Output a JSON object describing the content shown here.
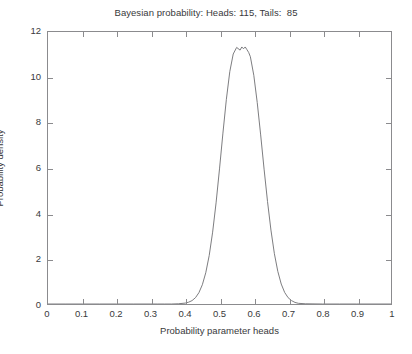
{
  "figure": {
    "background_color": "#ffffff",
    "axes_color": "#8b8b8e",
    "text_color": "#39393b",
    "curve_color": "#6e6e72"
  },
  "chart_data": {
    "type": "line",
    "title": "Bayesian probability: Heads: 115, Tails:  85",
    "xlabel": "Probability parameter heads",
    "ylabel": "Probability density",
    "xlim": [
      0,
      1
    ],
    "ylim": [
      0,
      12
    ],
    "grid": false,
    "legend": null,
    "xticks": [
      0,
      0.1,
      0.2,
      0.3,
      0.4,
      0.5,
      0.6,
      0.7,
      0.8,
      0.9,
      1
    ],
    "xtick_labels": [
      "0",
      "0.1",
      "0.2",
      "0.3",
      "0.4",
      "0.5",
      "0.6",
      "0.7",
      "0.8",
      "0.9",
      "1"
    ],
    "yticks": [
      0,
      2,
      4,
      6,
      8,
      10,
      12
    ],
    "ytick_labels": [
      "0",
      "2",
      "4",
      "6",
      "8",
      "10",
      "12"
    ],
    "observations": {
      "heads": 115,
      "tails": 85,
      "total": 200
    },
    "distribution": {
      "name": "Beta posterior",
      "alpha": 116,
      "beta": 86,
      "mode": 0.575,
      "mean": 0.5743,
      "peak_density": 11.34
    },
    "annotations": [],
    "series": [
      {
        "name": "Posterior probability density",
        "x": [
          0.0,
          0.05,
          0.1,
          0.15,
          0.2,
          0.25,
          0.3,
          0.32,
          0.34,
          0.36,
          0.38,
          0.4,
          0.41,
          0.42,
          0.43,
          0.44,
          0.45,
          0.46,
          0.47,
          0.48,
          0.49,
          0.5,
          0.51,
          0.52,
          0.53,
          0.54,
          0.55,
          0.56,
          0.565,
          0.57,
          0.575,
          0.58,
          0.585,
          0.59,
          0.6,
          0.61,
          0.62,
          0.63,
          0.64,
          0.65,
          0.66,
          0.67,
          0.68,
          0.69,
          0.7,
          0.71,
          0.72,
          0.73,
          0.75,
          0.8,
          0.85,
          0.9,
          1.0
        ],
        "y": [
          0.0,
          0.0,
          0.0,
          0.0,
          0.0,
          0.0,
          0.0,
          0.0,
          0.0,
          0.0,
          0.01,
          0.04,
          0.08,
          0.15,
          0.28,
          0.5,
          0.85,
          1.38,
          2.14,
          3.17,
          4.46,
          5.96,
          7.54,
          9.03,
          10.25,
          11.03,
          11.32,
          11.2,
          11.34,
          11.26,
          11.34,
          11.22,
          11.1,
          10.91,
          10.09,
          8.89,
          7.46,
          5.95,
          4.52,
          3.26,
          2.22,
          1.44,
          0.88,
          0.51,
          0.28,
          0.15,
          0.07,
          0.03,
          0.01,
          0.0,
          0.0,
          0.0,
          0.0
        ]
      }
    ]
  }
}
